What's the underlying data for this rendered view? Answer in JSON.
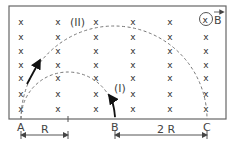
{
  "diagram": {
    "field_symbol": "x",
    "field_label": "B",
    "field_direction": "into page",
    "points": {
      "A": "A",
      "B": "B",
      "C": "C"
    },
    "paths": {
      "inner": "(I)",
      "outer": "(II)"
    },
    "dimensions": {
      "AB_label": "R",
      "BC_label": "2 R"
    },
    "colors": {
      "line": "#555555",
      "dashed": "#777777",
      "arrow": "#111111"
    }
  }
}
